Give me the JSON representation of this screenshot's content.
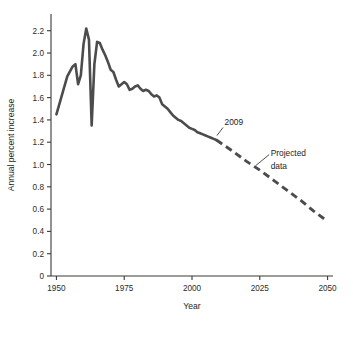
{
  "chart_data": {
    "type": "line",
    "title": "",
    "xlabel": "Year",
    "ylabel": "Annual percent increase",
    "xlim": [
      1948,
      2052
    ],
    "ylim": [
      0,
      2.35
    ],
    "x_ticks": [
      1950,
      1975,
      2000,
      2025,
      2050
    ],
    "x_tick_labels": [
      "1950",
      "1975",
      "2000",
      "2025",
      "2050"
    ],
    "y_ticks": [
      0,
      0.2,
      0.4,
      0.6,
      0.8,
      1.0,
      1.2,
      1.4,
      1.6,
      1.8,
      2.0,
      2.2
    ],
    "y_tick_labels": [
      "0",
      "0.2",
      "0.4",
      "0.6",
      "0.8",
      "1.0",
      "1.2",
      "1.4",
      "1.6",
      "1.8",
      "2.0",
      "2.2"
    ],
    "grid": false,
    "legend": "none",
    "line_color": "#4c4c4c",
    "annotations": [
      {
        "name": "year-2009-label",
        "text": "2009",
        "x": 2012,
        "y": 1.35
      },
      {
        "name": "projected-data-label",
        "text": "Projected",
        "x": 2029,
        "y": 1.08
      },
      {
        "name": "projected-data-label-2",
        "text": "data",
        "x": 2029,
        "y": 0.96
      }
    ],
    "series": [
      {
        "name": "Observed",
        "style": "solid",
        "x": [
          1950,
          1952,
          1954,
          1956,
          1957,
          1958,
          1959,
          1960,
          1961,
          1962,
          1963,
          1964,
          1965,
          1966,
          1967,
          1968,
          1969,
          1970,
          1971,
          1972,
          1973,
          1974,
          1975,
          1976,
          1977,
          1978,
          1979,
          1980,
          1981,
          1982,
          1983,
          1984,
          1985,
          1986,
          1987,
          1988,
          1989,
          1990,
          1991,
          1992,
          1993,
          1994,
          1995,
          1996,
          1997,
          1998,
          1999,
          2000,
          2001,
          2002,
          2003,
          2004,
          2005,
          2006,
          2007,
          2008,
          2009
        ],
        "y": [
          1.45,
          1.62,
          1.79,
          1.88,
          1.9,
          1.72,
          1.8,
          2.08,
          2.22,
          2.12,
          1.35,
          1.9,
          2.1,
          2.09,
          2.03,
          1.98,
          1.92,
          1.85,
          1.83,
          1.76,
          1.7,
          1.72,
          1.74,
          1.72,
          1.67,
          1.68,
          1.7,
          1.71,
          1.68,
          1.66,
          1.67,
          1.66,
          1.63,
          1.61,
          1.62,
          1.6,
          1.54,
          1.52,
          1.5,
          1.47,
          1.44,
          1.42,
          1.4,
          1.39,
          1.37,
          1.35,
          1.33,
          1.32,
          1.31,
          1.29,
          1.28,
          1.27,
          1.26,
          1.25,
          1.24,
          1.23,
          1.22
        ]
      },
      {
        "name": "Projected data",
        "style": "dashed",
        "x": [
          2009,
          2015,
          2020,
          2025,
          2030,
          2035,
          2040,
          2045,
          2050
        ],
        "y": [
          1.22,
          1.12,
          1.03,
          0.95,
          0.86,
          0.77,
          0.68,
          0.58,
          0.49
        ]
      }
    ]
  }
}
